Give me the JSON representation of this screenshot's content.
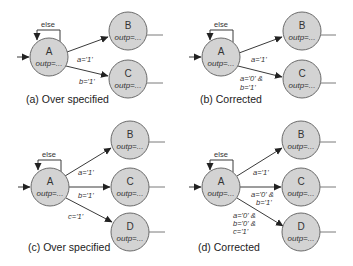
{
  "diagram": {
    "type": "state-machine-comparison",
    "state_fill": "#d3d3d3",
    "state_stroke": "#6a6a6a",
    "output_label": "outp=...",
    "self_loop_label": "else",
    "panels": [
      {
        "id": "a",
        "caption": "(a) Over specified",
        "states": [
          "A",
          "B",
          "C"
        ],
        "transitions": [
          {
            "from": "A",
            "to": "A",
            "label": "else"
          },
          {
            "from": "A",
            "to": "B",
            "label": [
              "a='1'"
            ]
          },
          {
            "from": "A",
            "to": "C",
            "label": [
              "b='1'"
            ]
          }
        ]
      },
      {
        "id": "b",
        "caption": "(b) Corrected",
        "states": [
          "A",
          "B",
          "C"
        ],
        "transitions": [
          {
            "from": "A",
            "to": "A",
            "label": "else"
          },
          {
            "from": "A",
            "to": "B",
            "label": [
              "a='1'"
            ]
          },
          {
            "from": "A",
            "to": "C",
            "label": [
              "a='0' &",
              "b='1'"
            ]
          }
        ]
      },
      {
        "id": "c",
        "caption": "(c) Over specified",
        "states": [
          "A",
          "B",
          "C",
          "D"
        ],
        "transitions": [
          {
            "from": "A",
            "to": "A",
            "label": "else"
          },
          {
            "from": "A",
            "to": "B",
            "label": [
              "a='1'"
            ]
          },
          {
            "from": "A",
            "to": "C",
            "label": [
              "b='1'"
            ]
          },
          {
            "from": "A",
            "to": "D",
            "label": [
              "c='1'"
            ]
          }
        ]
      },
      {
        "id": "d",
        "caption": "(d) Corrected",
        "states": [
          "A",
          "B",
          "C",
          "D"
        ],
        "transitions": [
          {
            "from": "A",
            "to": "A",
            "label": "else"
          },
          {
            "from": "A",
            "to": "B",
            "label": [
              "a='1'"
            ]
          },
          {
            "from": "A",
            "to": "C",
            "label": [
              "a='0' &",
              "b='1'"
            ]
          },
          {
            "from": "A",
            "to": "D",
            "label": [
              "a='0' &",
              "b='0' &",
              "c='1'"
            ]
          }
        ]
      }
    ]
  }
}
